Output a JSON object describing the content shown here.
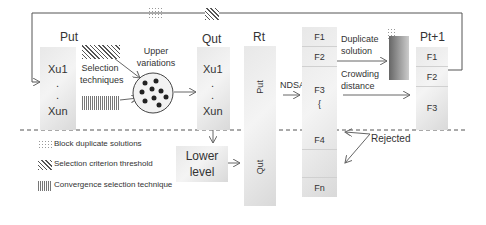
{
  "diagram": {
    "put_block": {
      "title": "Put",
      "items": [
        "Xu1",
        ".",
        ".",
        "Xun"
      ]
    },
    "qut_block": {
      "title": "Qut",
      "items": [
        "Xu1",
        ".",
        ".",
        "Xun"
      ]
    },
    "selection_label": "Selection techniques",
    "upper_label": "Upper variations",
    "rt_block": {
      "title": "Rt",
      "upper": "Put",
      "lower": "Qut"
    },
    "ndsa_label": "NDSA",
    "fronts": [
      "F1",
      "F2",
      "F3",
      "{",
      "F4",
      "Fn"
    ],
    "duplicate_label": "Duplicate solution",
    "crowding_label": "Crowding distance",
    "next_block": {
      "title": "Pt+1",
      "items": [
        "F1",
        "F2",
        "F3"
      ]
    },
    "lower_level_label": "Lower level",
    "rejected_label": "Rejected",
    "legend": [
      {
        "pattern": "dots",
        "label": "Block duplicate solutions"
      },
      {
        "pattern": "diagonal-hatch",
        "label": "Selection criterion threshold"
      },
      {
        "pattern": "vertical-hatch",
        "label": "Convergence selection technique"
      }
    ]
  }
}
